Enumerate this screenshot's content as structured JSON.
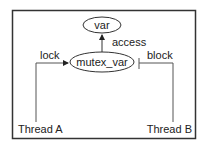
{
  "diagram": {
    "nodes": {
      "var": "var",
      "mutex_var": "mutex_var",
      "thread_a": "Thread A",
      "thread_b": "Thread B"
    },
    "edges": {
      "access": "access",
      "lock": "lock",
      "block": "block"
    },
    "colors": {
      "stroke": "#333333",
      "text": "#222222",
      "background": "#ffffff"
    }
  }
}
